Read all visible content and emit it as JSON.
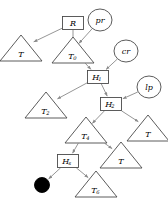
{
  "diagram": {
    "background_color": "#ffffff",
    "node_stroke_color": "#4a4a4a",
    "edge_color": "#8a8a8a",
    "label_color": "#000000",
    "nodes": [
      {
        "id": "R",
        "label": "R",
        "sub": "",
        "shape": "box",
        "x": 73,
        "y": 23
      },
      {
        "id": "pr",
        "label": "pr",
        "sub": "",
        "shape": "ellipse",
        "x": 100,
        "y": 20
      },
      {
        "id": "T_a",
        "label": "T",
        "sub": "",
        "shape": "triangle",
        "x": 21,
        "y": 48
      },
      {
        "id": "T0",
        "label": "T",
        "sub": "0",
        "shape": "triangle",
        "x": 73,
        "y": 50
      },
      {
        "id": "cr",
        "label": "cr",
        "sub": "",
        "shape": "ellipse",
        "x": 126,
        "y": 51
      },
      {
        "id": "H1",
        "label": "H",
        "sub": "1",
        "shape": "box",
        "x": 98,
        "y": 77
      },
      {
        "id": "lp",
        "label": "lp",
        "sub": "",
        "shape": "ellipse",
        "x": 149,
        "y": 87
      },
      {
        "id": "T2",
        "label": "T",
        "sub": "2",
        "shape": "triangle",
        "x": 46,
        "y": 105
      },
      {
        "id": "H2",
        "label": "H",
        "sub": "2",
        "shape": "box",
        "x": 111,
        "y": 104
      },
      {
        "id": "T4",
        "label": "T",
        "sub": "4",
        "shape": "triangle",
        "x": 86,
        "y": 130
      },
      {
        "id": "T_b",
        "label": "T",
        "sub": "",
        "shape": "triangle",
        "x": 148,
        "y": 128
      },
      {
        "id": "Hs",
        "label": "H",
        "sub": "s",
        "shape": "box",
        "x": 68,
        "y": 161
      },
      {
        "id": "T_c",
        "label": "T",
        "sub": "",
        "shape": "triangle",
        "x": 121,
        "y": 155
      },
      {
        "id": "dot",
        "label": "",
        "sub": "",
        "shape": "dot",
        "x": 42,
        "y": 185
      },
      {
        "id": "T6",
        "label": "T",
        "sub": "6",
        "shape": "triangle",
        "x": 96,
        "y": 184
      }
    ],
    "edges": [
      {
        "from": "R",
        "to": "T_a",
        "arrow": true
      },
      {
        "from": "R",
        "to": "T0",
        "arrow": true
      },
      {
        "from": "pr",
        "to": "T0",
        "arrow": true
      },
      {
        "from": "T0",
        "to": "H1",
        "arrow": true
      },
      {
        "from": "cr",
        "to": "H1",
        "arrow": true
      },
      {
        "from": "H1",
        "to": "T2",
        "arrow": true
      },
      {
        "from": "H1",
        "to": "H2",
        "arrow": true
      },
      {
        "from": "lp",
        "to": "H2",
        "arrow": true
      },
      {
        "from": "H2",
        "to": "T4",
        "arrow": true
      },
      {
        "from": "H2",
        "to": "T_b",
        "arrow": true
      },
      {
        "from": "T4",
        "to": "Hs",
        "arrow": true
      },
      {
        "from": "T4",
        "to": "T_c",
        "arrow": true
      },
      {
        "from": "Hs",
        "to": "dot",
        "arrow": true
      },
      {
        "from": "Hs",
        "to": "T6",
        "arrow": true
      }
    ]
  }
}
